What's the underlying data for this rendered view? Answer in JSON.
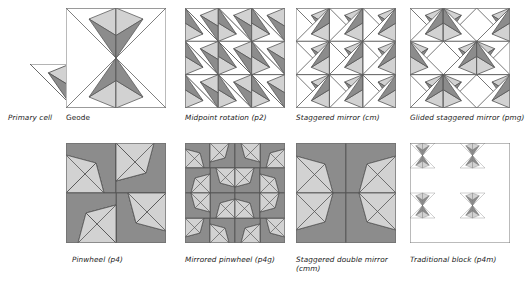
{
  "figure": {
    "background_color": "#ffffff",
    "palette": {
      "white": "#ffffff",
      "light_gray": "#d2d2d2",
      "dark_gray": "#8c8c8c",
      "outline": "#555555",
      "text": "#1b1b1b"
    }
  },
  "primary_cell": {
    "label": "Primary cell",
    "label_style": "italic",
    "description": "Right triangle cell divided into white, light gray and dark gray regions",
    "regions": [
      "white",
      "light_gray",
      "dark_gray"
    ]
  },
  "blocks": [
    {
      "id": "geode",
      "label": "Geode",
      "label_style": "upright",
      "symmetry_group": "",
      "grid": "2x2",
      "description": "Four primary cells mirrored into a four pointed star"
    },
    {
      "id": "midpoint-rotation",
      "label": "Midpoint rotation (p2)",
      "label_style": "italic",
      "symmetry_group": "p2",
      "grid": "3x3",
      "description": "Cells rotated 180 degrees about cell midpoints"
    },
    {
      "id": "staggered-mirror",
      "label": "Staggered mirror (cm)",
      "label_style": "italic",
      "symmetry_group": "cm",
      "grid": "3x3",
      "description": "Mirrored cells offset row by row"
    },
    {
      "id": "glided-staggered-mirror",
      "label": "Glided staggered mirror (pmg)",
      "label_style": "italic",
      "symmetry_group": "pmg",
      "grid": "3x3",
      "description": "Glide reflected staggered mirror arrangement"
    },
    {
      "id": "pinwheel",
      "label": "Pinwheel (p4)",
      "label_style": "italic",
      "symmetry_group": "p4",
      "grid": "2x2",
      "description": "Four fold rotation pinwheel of the primary cell"
    },
    {
      "id": "mirrored-pinwheel",
      "label": "Mirrored pinwheel (p4g)",
      "label_style": "italic",
      "symmetry_group": "p4g",
      "grid": "4x4",
      "description": "Pinwheel with mirror axes producing star rosettes"
    },
    {
      "id": "staggered-double-mirror",
      "label": "Staggered double mirror (cmm)",
      "label_style": "italic",
      "symmetry_group": "cmm",
      "grid": "2x2",
      "description": "Double mirrored cells in staggered arrangement"
    },
    {
      "id": "traditional-block",
      "label": "Traditional block (p4m)",
      "label_style": "italic",
      "symmetry_group": "p4m",
      "grid": "4x4",
      "description": "Two by two repeat of the geode star motif"
    }
  ]
}
